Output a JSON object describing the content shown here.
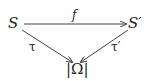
{
  "nodes": {
    "source": "S",
    "target": "S′",
    "bottom": "|Ω|"
  },
  "arrows": {
    "top": {
      "label": "f",
      "from": "S",
      "to": "S′"
    },
    "left": {
      "label": "τ",
      "from": "S",
      "to": "|Ω|"
    },
    "right": {
      "label": "τ′",
      "from": "S′",
      "to": "|Ω|"
    }
  },
  "colors": {
    "stroke": "#444444",
    "text": "#222222"
  }
}
